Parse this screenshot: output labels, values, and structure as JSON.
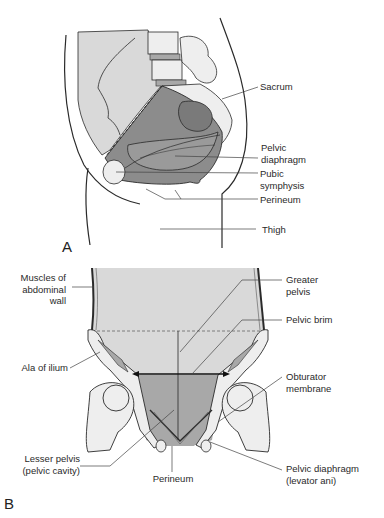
{
  "panels": [
    {
      "id": "A",
      "letter": "A",
      "view": "sagittal",
      "labels": {
        "sacrum": "Sacrum",
        "pelvic_diaphragm_1": "Pelvic",
        "pelvic_diaphragm_2": "diaphragm",
        "pubic_symphysis_1": "Pubic",
        "pubic_symphysis_2": "symphysis",
        "perineum": "Perineum",
        "thigh": "Thigh"
      }
    },
    {
      "id": "B",
      "letter": "B",
      "view": "coronal",
      "labels": {
        "muscles_1": "Muscles of",
        "muscles_2": "abdominal",
        "muscles_3": "wall",
        "greater_pelvis_1": "Greater",
        "greater_pelvis_2": "pelvis",
        "pelvic_brim": "Pelvic brim",
        "ala_of_ilium": "Ala of ilium",
        "obturator_1": "Obturator",
        "obturator_2": "membrane",
        "lesser_pelvis_1": "Lesser pelvis",
        "lesser_pelvis_2": "(pelvic cavity)",
        "perineum": "Perineum",
        "pelvic_diaphragm_1": "Pelvic diaphragm",
        "pelvic_diaphragm_2": "(levator ani)"
      }
    }
  ],
  "colors": {
    "background": "#ffffff",
    "outline": "#2a2a2a",
    "light_gray": "#d9d9d9",
    "medium_gray": "#a8a8a8",
    "dark_gray": "#8c8c8c",
    "bone": "#eeeeee",
    "leader_line": "#444444"
  }
}
